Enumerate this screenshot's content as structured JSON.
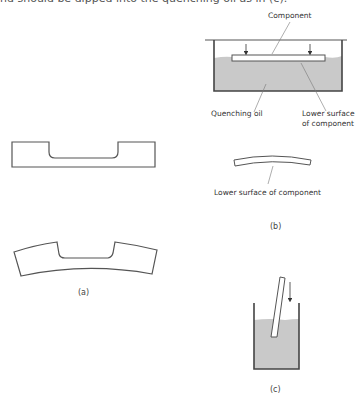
{
  "top_text": "nd should be dipped into the quenching oil as in (c).",
  "colors": {
    "line": "#555555",
    "oil": "#c9c9c9",
    "text": "#333333"
  },
  "figure_a": {
    "caption": "(a)"
  },
  "figure_b": {
    "caption": "(b)",
    "labels": {
      "component": "Component",
      "quenching_oil": "Quenching oil",
      "lower_surface_line1": "Lower surface",
      "lower_surface_line2": "of component",
      "lower_surface_bent": "Lower surface of component"
    }
  },
  "figure_c": {
    "caption": "(c)"
  }
}
